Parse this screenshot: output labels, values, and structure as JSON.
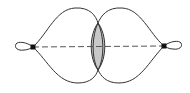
{
  "diagram": {
    "colors": {
      "stroke": "#333333",
      "dash": "#555555",
      "lens_fill": "#c8c8c8",
      "node": "#111111",
      "background": "#ffffff"
    },
    "nodes": [
      {
        "id": "left-vertex"
      },
      {
        "id": "right-vertex"
      }
    ],
    "edges": [
      {
        "from": "left-vertex",
        "to": "right-vertex",
        "style": "dashed"
      }
    ],
    "loops": [
      "left-vertex",
      "right-vertex"
    ],
    "regions": [
      {
        "id": "overlap-lens",
        "shaded": true
      }
    ]
  }
}
